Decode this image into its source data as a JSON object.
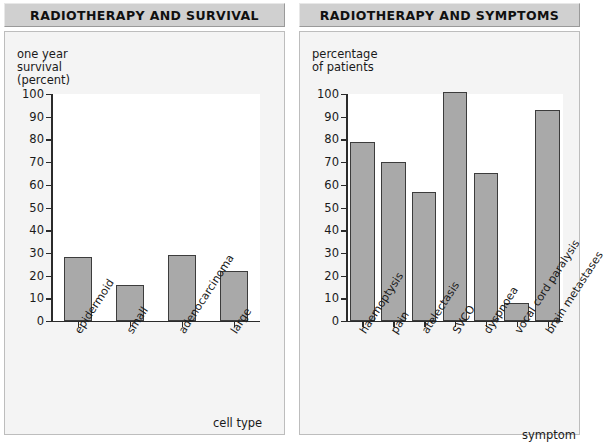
{
  "panels": [
    {
      "title": "RADIOTHERAPY AND SURVIVAL",
      "y_caption": "one year\nsurvival\n(percent)",
      "x_title": "cell type"
    },
    {
      "title": "RADIOTHERAPY AND SYMPTOMS",
      "y_caption": "percentage\nof patients",
      "x_title": "symptom"
    }
  ],
  "colors": {
    "bar_fill": "#a9a9a9",
    "bar_stroke": "#3c3c3c",
    "axis": "#2b2b2b",
    "panel_bg": "#f4f4f4",
    "title_bg": "#d0d0d0",
    "plot_bg": "#ffffff"
  },
  "chart_data": [
    {
      "type": "bar",
      "title": "RADIOTHERAPY AND SURVIVAL",
      "categories": [
        "epidermoid",
        "small",
        "adenocarcinoma",
        "large"
      ],
      "values": [
        28,
        16,
        29,
        22
      ],
      "xlabel": "cell type",
      "ylabel": "one year survival (percent)",
      "ylim": [
        0,
        100
      ],
      "yticks": [
        0,
        10,
        20,
        30,
        40,
        50,
        60,
        70,
        80,
        90,
        100
      ],
      "grid": false,
      "legend": "none"
    },
    {
      "type": "bar",
      "title": "RADIOTHERAPY AND SYMPTOMS",
      "categories": [
        "haemoptysis",
        "pain",
        "atelectasis",
        "SVCO",
        "dyspnoea",
        "vocal cord paralysis",
        "brain metastases"
      ],
      "values": [
        79,
        70,
        57,
        101,
        65,
        8,
        93
      ],
      "xlabel": "symptom",
      "ylabel": "percentage of patients",
      "ylim": [
        0,
        100
      ],
      "yticks": [
        0,
        10,
        20,
        30,
        40,
        50,
        60,
        70,
        80,
        90,
        100
      ],
      "grid": false,
      "legend": "none"
    }
  ]
}
